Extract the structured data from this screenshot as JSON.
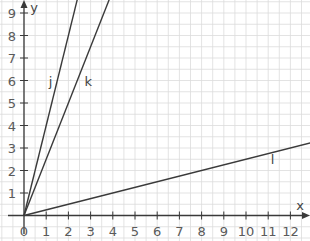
{
  "chart_data": {
    "type": "line",
    "title": "",
    "xlabel": "x",
    "ylabel": "y",
    "xlim": [
      0,
      12.9
    ],
    "ylim": [
      0,
      9.6
    ],
    "grid": true,
    "grid_minor_step": 0.5,
    "x_ticks": [
      "0",
      "1",
      "2",
      "3",
      "4",
      "5",
      "6",
      "7",
      "8",
      "9",
      "10",
      "11",
      "12"
    ],
    "y_ticks": [
      "1",
      "2",
      "3",
      "4",
      "5",
      "6",
      "7",
      "8",
      "9"
    ],
    "series": [
      {
        "name": "j",
        "equation": "y = 4x",
        "slope": 4,
        "points": [
          [
            0,
            0
          ],
          [
            2.4,
            9.6
          ]
        ],
        "label_pos": [
          1.2,
          6
        ]
      },
      {
        "name": "k",
        "equation": "y = 2.5x",
        "slope": 2.5,
        "points": [
          [
            0,
            0
          ],
          [
            3.84,
            9.6
          ]
        ],
        "label_pos": [
          2.9,
          6
        ]
      },
      {
        "name": "l",
        "equation": "y = 0.25x",
        "slope": 0.25,
        "points": [
          [
            0,
            0
          ],
          [
            12.9,
            3.225
          ]
        ],
        "label_pos": [
          11.2,
          2.5
        ]
      }
    ],
    "colors": {
      "line": "#3a3a3a",
      "axis": "#3a3a3a",
      "grid": "#dcdcdc",
      "tick_text": "#5a5a5a"
    }
  }
}
